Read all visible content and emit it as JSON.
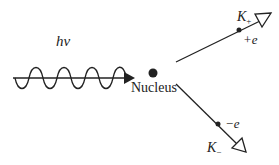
{
  "diagram": {
    "photon": {
      "label": "hv",
      "label_display": "hν"
    },
    "nucleus": {
      "label": "Nucleus"
    },
    "particles": [
      {
        "name": "K+",
        "label_main": "K",
        "label_sub": "+",
        "charge": "+e"
      },
      {
        "name": "K-",
        "label_main": "K",
        "label_sub": "−",
        "charge": "−e"
      }
    ],
    "colors": {
      "stroke": "#222222",
      "background": "#ffffff"
    }
  }
}
